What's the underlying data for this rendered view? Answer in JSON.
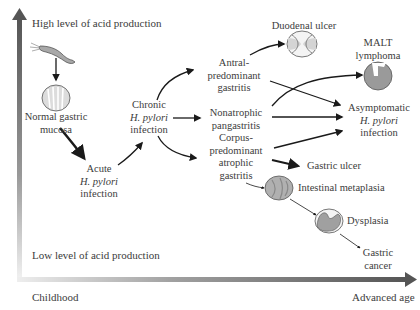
{
  "axes": {
    "y_high": "High level of acid production",
    "y_low": "Low level of acid production",
    "x_start": "Childhood",
    "x_end": "Advanced age"
  },
  "nodes": {
    "normal": {
      "line1": "Normal gastric",
      "line2": "mucosa"
    },
    "acute": {
      "line1": "Acute",
      "line2": "H. pylori",
      "line3": "infection"
    },
    "chronic": {
      "line1": "Chronic",
      "line2": "H. pylori",
      "line3": "infection"
    },
    "antral": {
      "line1": "Antral-",
      "line2": "predominant",
      "line3": "gastritis"
    },
    "nonatrophic": {
      "line1": "Nonatrophic",
      "line2": "pangastritis"
    },
    "corpus": {
      "line1": "Corpus-",
      "line2": "predominant",
      "line3": "atrophic",
      "line4": "gastritis"
    },
    "duodenal": {
      "label": "Duodenal ulcer"
    },
    "malt": {
      "line1": "MALT",
      "line2": "lymphoma"
    },
    "asymptomatic": {
      "line1": "Asymptomatic",
      "line2": "H. pylori",
      "line3": "infection"
    },
    "gastric_ulcer": {
      "label": "Gastric ulcer"
    },
    "metaplasia": {
      "label": "Intestinal metaplasia"
    },
    "dysplasia": {
      "label": "Dysplasia"
    },
    "cancer": {
      "line1": "Gastric",
      "line2": "cancer"
    }
  },
  "colors": {
    "axis_dark": "#5a5a5a",
    "icon_fill": "#a8a8a8",
    "icon_light": "#dcdcdc",
    "arrow": "#1a1a1a"
  }
}
